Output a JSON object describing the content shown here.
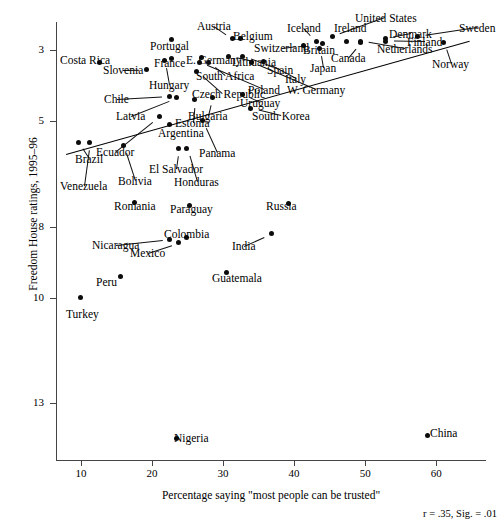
{
  "chart_data": {
    "type": "scatter",
    "title": "",
    "xlabel": "Percentage saying \"most people can be trusted\"",
    "ylabel": "Freedom House ratings, 1995–96",
    "annotation": "r = .35, Sig. = .01",
    "xlim": [
      6.5,
      67
    ],
    "ylim": [
      2.2,
      14.6
    ],
    "y_inverted": true,
    "grid": false,
    "legend": "none",
    "xticks": [
      10,
      20,
      30,
      40,
      50,
      60
    ],
    "yticks": [
      3,
      5,
      8,
      10,
      13
    ],
    "trendline": {
      "x0": 7.9,
      "y0": 5.95,
      "x1": 64.6,
      "y1": 2.75
    },
    "points": [
      {
        "name": "Costa Rica",
        "x": 12.6,
        "y": 3.35,
        "lx": 60,
        "ly": 54,
        "anchor": "left"
      },
      {
        "name": "Portugal",
        "x": 22.8,
        "y": 2.7,
        "lx": 150,
        "ly": 40,
        "anchor": "left"
      },
      {
        "name": "Slovenia",
        "x": 19.3,
        "y": 3.55,
        "lx": 103,
        "ly": 64,
        "anchor": "left"
      },
      {
        "name": "Austria",
        "x": 31.4,
        "y": 2.68,
        "lx": 197,
        "ly": 20,
        "anchor": "left"
      },
      {
        "name": "Belgium",
        "x": 32.4,
        "y": 2.68,
        "lx": 233,
        "ly": 30,
        "anchor": "left"
      },
      {
        "name": "Iceland",
        "x": 43.1,
        "y": 2.75,
        "lx": 287,
        "ly": 22,
        "anchor": "left"
      },
      {
        "name": "Ireland",
        "x": 47.4,
        "y": 2.75,
        "lx": 334,
        "ly": 22,
        "anchor": "left"
      },
      {
        "name": "United States",
        "x": 45.4,
        "y": 2.62,
        "lx": 355,
        "ly": 12,
        "anchor": "left"
      },
      {
        "name": "Denmark",
        "x": 52.8,
        "y": 2.68,
        "lx": 389,
        "ly": 28,
        "anchor": "left"
      },
      {
        "name": "Sweden",
        "x": 57.4,
        "y": 2.62,
        "lx": 459,
        "ly": 22,
        "anchor": "left"
      },
      {
        "name": "Netherlands",
        "x": 49.4,
        "y": 2.75,
        "lx": 377,
        "ly": 43,
        "anchor": "left"
      },
      {
        "name": "Finland",
        "x": 52.8,
        "y": 2.75,
        "lx": 407,
        "ly": 36,
        "anchor": "left"
      },
      {
        "name": "Norway",
        "x": 61.0,
        "y": 2.78,
        "lx": 432,
        "ly": 58,
        "anchor": "left"
      },
      {
        "name": "Canada",
        "x": 49.4,
        "y": 2.78,
        "lx": 331,
        "ly": 52,
        "anchor": "left"
      },
      {
        "name": "Britain",
        "x": 44.0,
        "y": 2.82,
        "lx": 303,
        "ly": 44,
        "anchor": "left"
      },
      {
        "name": "Switzerland",
        "x": 41.3,
        "y": 2.86,
        "lx": 254,
        "ly": 42,
        "anchor": "left"
      },
      {
        "name": "Japan",
        "x": 43.6,
        "y": 2.95,
        "lx": 310,
        "ly": 62,
        "anchor": "left"
      },
      {
        "name": "Lithuania",
        "x": 30.8,
        "y": 3.18,
        "lx": 232,
        "ly": 56,
        "anchor": "left"
      },
      {
        "name": "Spain",
        "x": 32.8,
        "y": 3.18,
        "lx": 267,
        "ly": 64,
        "anchor": "left"
      },
      {
        "name": "Italy",
        "x": 35.7,
        "y": 3.33,
        "lx": 285,
        "ly": 73,
        "anchor": "left"
      },
      {
        "name": "E. Germany",
        "x": 27.0,
        "y": 3.2,
        "lx": 186,
        "ly": 54,
        "anchor": "left"
      },
      {
        "name": "W. Germany",
        "x": 34.0,
        "y": 3.35,
        "lx": 287,
        "ly": 84,
        "anchor": "left"
      },
      {
        "name": "Poland",
        "x": 26.7,
        "y": 3.35,
        "lx": 248,
        "ly": 84,
        "anchor": "left"
      },
      {
        "name": "France",
        "x": 22.8,
        "y": 3.22,
        "lx": 154,
        "ly": 57,
        "anchor": "left"
      },
      {
        "name": "Hungary",
        "x": 21.8,
        "y": 3.3,
        "lx": 149,
        "ly": 79,
        "anchor": "left"
      },
      {
        "name": "South Africa",
        "x": 28.0,
        "y": 3.35,
        "lx": 196,
        "ly": 70,
        "anchor": "left"
      },
      {
        "name": "Czech Republic",
        "x": 26.3,
        "y": 3.6,
        "lx": 192,
        "ly": 88,
        "anchor": "left"
      },
      {
        "name": "Chile",
        "x": 22.5,
        "y": 4.3,
        "lx": 104,
        "ly": 93,
        "anchor": "left"
      },
      {
        "name": "Latvia",
        "x": 23.4,
        "y": 4.35,
        "lx": 116,
        "ly": 110,
        "anchor": "left"
      },
      {
        "name": "Uruguay",
        "x": 32.7,
        "y": 4.25,
        "lx": 240,
        "ly": 97,
        "anchor": "left"
      },
      {
        "name": "Bulgaria",
        "x": 28.5,
        "y": 4.35,
        "lx": 188,
        "ly": 110,
        "anchor": "left"
      },
      {
        "name": "South Korea",
        "x": 33.9,
        "y": 4.65,
        "lx": 252,
        "ly": 110,
        "anchor": "left"
      },
      {
        "name": "Estonia",
        "x": 26.0,
        "y": 4.4,
        "lx": 175,
        "ly": 117,
        "anchor": "left"
      },
      {
        "name": "Argentina",
        "x": 22.5,
        "y": 5.1,
        "lx": 158,
        "ly": 127,
        "anchor": "left"
      },
      {
        "name": "Ecuador",
        "x": 21.0,
        "y": 4.88,
        "lx": 96,
        "ly": 146,
        "anchor": "left"
      },
      {
        "name": "Panama",
        "x": 27.1,
        "y": 5.0,
        "lx": 199,
        "ly": 147,
        "anchor": "left"
      },
      {
        "name": "Brazil",
        "x": 9.6,
        "y": 5.6,
        "lx": 75,
        "ly": 153,
        "anchor": "left"
      },
      {
        "name": "Venezuela",
        "x": 11.2,
        "y": 5.62,
        "lx": 60,
        "ly": 180,
        "anchor": "left"
      },
      {
        "name": "Bolivia",
        "x": 16.0,
        "y": 5.7,
        "lx": 118,
        "ly": 175,
        "anchor": "left"
      },
      {
        "name": "El Salvador",
        "x": 23.8,
        "y": 5.78,
        "lx": 149,
        "ly": 163,
        "anchor": "left"
      },
      {
        "name": "Honduras",
        "x": 24.9,
        "y": 5.78,
        "lx": 174,
        "ly": 176,
        "anchor": "left"
      },
      {
        "name": "Romania",
        "x": 17.5,
        "y": 7.3,
        "lx": 114,
        "ly": 200,
        "anchor": "left"
      },
      {
        "name": "Paraguay",
        "x": 25.3,
        "y": 7.4,
        "lx": 170,
        "ly": 203,
        "anchor": "left"
      },
      {
        "name": "Russia",
        "x": 39.2,
        "y": 7.35,
        "lx": 266,
        "ly": 200,
        "anchor": "left"
      },
      {
        "name": "Nicaragua",
        "x": 22.5,
        "y": 8.35,
        "lx": 92,
        "ly": 239,
        "anchor": "left"
      },
      {
        "name": "Colombia",
        "x": 24.9,
        "y": 8.3,
        "lx": 164,
        "ly": 228,
        "anchor": "left"
      },
      {
        "name": "Mexico",
        "x": 23.8,
        "y": 8.45,
        "lx": 130,
        "ly": 247,
        "anchor": "left"
      },
      {
        "name": "India",
        "x": 36.8,
        "y": 8.2,
        "lx": 232,
        "ly": 240,
        "anchor": "left"
      },
      {
        "name": "Peru",
        "x": 15.6,
        "y": 9.4,
        "lx": 96,
        "ly": 276,
        "anchor": "left"
      },
      {
        "name": "Guatemala",
        "x": 30.5,
        "y": 9.28,
        "lx": 212,
        "ly": 272,
        "anchor": "left"
      },
      {
        "name": "Turkey",
        "x": 10.0,
        "y": 10.0,
        "lx": 66,
        "ly": 308,
        "anchor": "left"
      },
      {
        "name": "Nigeria",
        "x": 23.4,
        "y": 14.0,
        "lx": 174,
        "ly": 432,
        "anchor": "left"
      },
      {
        "name": "China",
        "x": 58.8,
        "y": 13.9,
        "lx": 430,
        "ly": 427,
        "anchor": "left"
      }
    ]
  }
}
